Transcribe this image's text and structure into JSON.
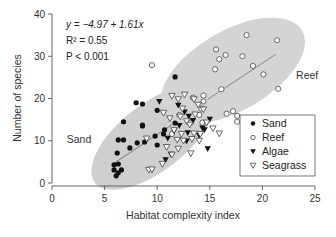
{
  "chart_data": {
    "type": "scatter",
    "title": "",
    "xlabel": "Habitat complexity index",
    "ylabel": "Number of species",
    "xlim": [
      0,
      25
    ],
    "ylim": [
      0,
      40
    ],
    "xticks": [
      0,
      5,
      10,
      15,
      20,
      25
    ],
    "yticks": [
      0,
      10,
      20,
      30,
      40
    ],
    "grid": false,
    "legend_position": "lower right",
    "annotations": {
      "equation": "y = −4.97 + 1.61x",
      "r2": "R² = 0.55",
      "p": "P < 0.001"
    },
    "group_labels": [
      {
        "text": "Sand",
        "x": 1.4,
        "y": 9.5
      },
      {
        "text": "Reef",
        "x": 23.2,
        "y": 24.5
      }
    ],
    "ellipses": [
      {
        "name": "Sand",
        "cx": 9.6,
        "cy": 10.8,
        "rx": 7.0,
        "ry": 3.6,
        "angle_deg": -38,
        "color": "#cfcfcf"
      },
      {
        "name": "Reef",
        "cx": 17.2,
        "cy": 26.6,
        "rx": 7.6,
        "ry": 4.3,
        "angle_deg": -30,
        "color": "#d4d4d4"
      }
    ],
    "regression_lines": [
      {
        "name": "Sand",
        "x": [
          5.8,
          11.4
        ],
        "y": [
          4.5,
          13.8
        ],
        "color": "#777777"
      },
      {
        "name": "Reef",
        "x": [
          14.8,
          21.3
        ],
        "y": [
          19.8,
          30.5
        ],
        "color": "#888888"
      }
    ],
    "series": [
      {
        "name": "Sand",
        "marker": "filled-circle",
        "points": [
          [
            8.0,
            19.0
          ],
          [
            8.6,
            18.7
          ],
          [
            6.8,
            14.5
          ],
          [
            8.6,
            13.5
          ],
          [
            8.6,
            13.7
          ],
          [
            6.3,
            10.2
          ],
          [
            6.8,
            10.2
          ],
          [
            6.2,
            7.1
          ],
          [
            7.4,
            8.3
          ],
          [
            8.1,
            9.5
          ],
          [
            8.8,
            9.7
          ],
          [
            9.8,
            11.1
          ],
          [
            10.6,
            11.6
          ],
          [
            10.0,
            9.0
          ],
          [
            5.9,
            4.3
          ],
          [
            6.3,
            4.5
          ],
          [
            5.9,
            3.1
          ],
          [
            6.3,
            2.4
          ],
          [
            6.6,
            3.1
          ],
          [
            6.1,
            1.7
          ],
          [
            11.7,
            25.1
          ],
          [
            11.7,
            14.2
          ],
          [
            10.7,
            12.6
          ],
          [
            10.0,
            17.2
          ]
        ]
      },
      {
        "name": "Reef",
        "marker": "open-circle",
        "points": [
          [
            9.5,
            27.9
          ],
          [
            18.5,
            35.0
          ],
          [
            21.4,
            33.8
          ],
          [
            15.6,
            31.6
          ],
          [
            16.5,
            30.3
          ],
          [
            18.1,
            30.0
          ],
          [
            15.9,
            29.3
          ],
          [
            15.5,
            26.9
          ],
          [
            20.1,
            25.7
          ],
          [
            16.1,
            22.2
          ],
          [
            14.4,
            20.7
          ],
          [
            14.4,
            19.3
          ],
          [
            17.2,
            17.0
          ],
          [
            17.6,
            15.9
          ],
          [
            17.6,
            14.5
          ],
          [
            14.0,
            16.1
          ],
          [
            14.3,
            14.3
          ],
          [
            13.2,
            14.3
          ],
          [
            21.5,
            22.3
          ],
          [
            19.1,
            27.7
          ],
          [
            16.6,
            16.4
          ],
          [
            12.1,
            16.1
          ],
          [
            11.4,
            11.6
          ],
          [
            13.4,
            20.2
          ],
          [
            14.2,
            17.6
          ]
        ]
      },
      {
        "name": "Algae",
        "marker": "filled-triangle-down",
        "points": [
          [
            12.0,
            18.4
          ],
          [
            12.6,
            16.8
          ],
          [
            13.4,
            14.8
          ],
          [
            14.3,
            13.0
          ],
          [
            14.0,
            11.2
          ],
          [
            12.8,
            9.9
          ],
          [
            11.3,
            6.8
          ],
          [
            10.8,
            5.5
          ],
          [
            14.8,
            8.1
          ],
          [
            9.5,
            3.1
          ],
          [
            12.1,
            13.6
          ],
          [
            13.0,
            15.8
          ],
          [
            14.5,
            12.6
          ],
          [
            10.2,
            19.3
          ],
          [
            12.9,
            11.9
          ],
          [
            11.6,
            12.3
          ],
          [
            15.0,
            15.1
          ],
          [
            11.0,
            10.6
          ]
        ]
      },
      {
        "name": "Seagrass",
        "marker": "open-triangle-down",
        "points": [
          [
            9.0,
            10.5
          ],
          [
            9.2,
            3.1
          ],
          [
            11.4,
            20.6
          ],
          [
            12.0,
            19.8
          ],
          [
            12.6,
            20.9
          ],
          [
            13.5,
            19.8
          ],
          [
            13.9,
            18.5
          ],
          [
            11.2,
            15.3
          ],
          [
            12.2,
            15.7
          ],
          [
            12.8,
            14.6
          ],
          [
            13.1,
            13.8
          ],
          [
            11.6,
            12.5
          ],
          [
            12.3,
            11.6
          ],
          [
            13.5,
            11.7
          ],
          [
            14.1,
            11.6
          ],
          [
            11.9,
            10.2
          ],
          [
            12.5,
            10.0
          ],
          [
            13.3,
            10.4
          ],
          [
            14.0,
            10.0
          ],
          [
            10.9,
            8.5
          ],
          [
            12.0,
            8.1
          ],
          [
            11.4,
            6.7
          ],
          [
            10.5,
            4.5
          ],
          [
            13.2,
            7.0
          ],
          [
            15.9,
            11.7
          ],
          [
            14.7,
            14.3
          ],
          [
            14.4,
            17.4
          ],
          [
            10.6,
            16.6
          ],
          [
            12.4,
            17.6
          ],
          [
            13.6,
            16.2
          ],
          [
            9.5,
            3.2
          ],
          [
            15.3,
            12.9
          ]
        ]
      }
    ]
  },
  "legend": {
    "items": [
      {
        "label": "Sand",
        "marker": "filled-circle"
      },
      {
        "label": "Reef",
        "marker": "open-circle"
      },
      {
        "label": "Algae",
        "marker": "filled-triangle-down"
      },
      {
        "label": "Seagrass",
        "marker": "open-triangle-down"
      }
    ]
  },
  "colors": {
    "axis": "#555555",
    "ellipse_fill": "#d0d0d0",
    "marker_dark": "#111111",
    "marker_light": "#ffffff",
    "regression": "#808080"
  }
}
